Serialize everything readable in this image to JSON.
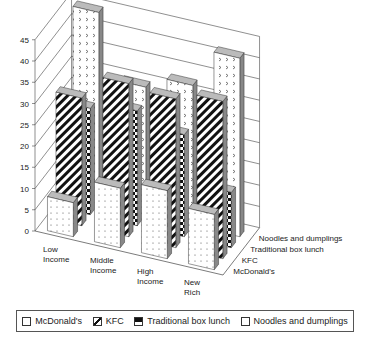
{
  "chart_data": {
    "type": "bar",
    "subtype": "3d-column",
    "title": "",
    "xlabel": "",
    "ylabel": "",
    "ylim": [
      0,
      45
    ],
    "yticks": [
      0,
      5,
      10,
      15,
      20,
      25,
      30,
      35,
      40,
      45
    ],
    "grid": true,
    "legend_position": "bottom",
    "categories": [
      "Low Income",
      "Middle Income",
      "High Income",
      "New Rich"
    ],
    "series": [
      {
        "name": "McDonald's",
        "values": [
          8,
          14,
          16,
          13
        ],
        "pattern": "dots"
      },
      {
        "name": "KFC",
        "values": [
          30,
          36,
          35,
          37
        ],
        "pattern": "diagonal-stripes"
      },
      {
        "name": "Traditional box lunch",
        "values": [
          25,
          27,
          24,
          13
        ],
        "pattern": "checkerboard"
      },
      {
        "name": "Noodles and dumplings",
        "values": [
          45,
          30,
          33,
          42
        ],
        "pattern": "chevron-dots"
      }
    ]
  },
  "axis": {
    "category_labels": [
      [
        "Low",
        "Income"
      ],
      [
        "Middle",
        "Income"
      ],
      [
        "High",
        "Income"
      ],
      [
        "New",
        "Rich"
      ]
    ],
    "depth_labels": [
      "McDonald's",
      "KFC",
      "Traditional box lunch",
      "Noodles and dumplings"
    ]
  },
  "legend": {
    "items": [
      {
        "label": "McDonald's"
      },
      {
        "label": "KFC"
      },
      {
        "label": "Traditional box lunch"
      },
      {
        "label": "Noodles and dumplings"
      }
    ]
  }
}
